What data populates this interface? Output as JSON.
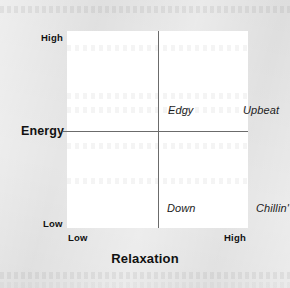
{
  "figure": {
    "type": "2x2-quadrant-matrix",
    "background_color": "#e3e3e3",
    "plot_background_color": "#ffffff",
    "axis_line_color": "#6b6b6b",
    "text_color": "#111111"
  },
  "axes": {
    "x": {
      "title": "Relaxation",
      "low_label": "Low",
      "high_label": "High"
    },
    "y": {
      "title": "Energy",
      "low_label": "Low",
      "high_label": "High"
    }
  },
  "quadrants": [
    {
      "id": "edgy",
      "label": "Edgy",
      "energy": "High",
      "relaxation": "Low"
    },
    {
      "id": "upbeat",
      "label": "Upbeat",
      "energy": "High",
      "relaxation": "High"
    },
    {
      "id": "down",
      "label": "Down",
      "energy": "Low",
      "relaxation": "Low"
    },
    {
      "id": "chillin",
      "label": "Chillin'",
      "energy": "Low",
      "relaxation": "High"
    }
  ],
  "chart_data": {
    "type": "scatter",
    "title": "",
    "xlabel": "Relaxation",
    "ylabel": "Energy",
    "xlim": [
      0,
      1
    ],
    "ylim": [
      0,
      1
    ],
    "xticklabels": [
      "Low",
      "High"
    ],
    "yticklabels": [
      "Low",
      "High"
    ],
    "grid": false,
    "legend": "none",
    "annotations": [
      {
        "text": "Edgy",
        "x": 0.27,
        "y": 0.78
      },
      {
        "text": "Upbeat",
        "x": 0.7,
        "y": 0.78
      },
      {
        "text": "Down",
        "x": 0.27,
        "y": 0.28
      },
      {
        "text": "Chillin'",
        "x": 0.72,
        "y": 0.28
      }
    ]
  }
}
